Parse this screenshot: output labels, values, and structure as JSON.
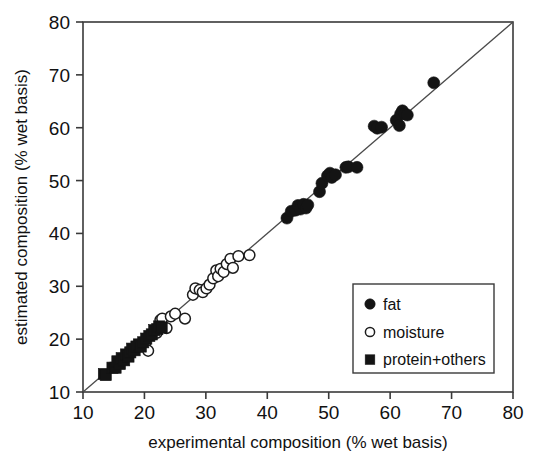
{
  "chart_data": {
    "type": "scatter",
    "title": "",
    "xlabel": "experimental composition (% wet basis)",
    "ylabel": "estimated composition (% wet basis)",
    "xlim": [
      10,
      80
    ],
    "ylim": [
      10,
      80
    ],
    "xticks": [
      10,
      20,
      30,
      40,
      50,
      60,
      70,
      80
    ],
    "yticks": [
      10,
      20,
      30,
      40,
      50,
      60,
      70,
      80
    ],
    "xtick_labels": [
      "10",
      "20",
      "30",
      "40",
      "50",
      "60",
      "70",
      "80"
    ],
    "ytick_labels": [
      "10",
      "20",
      "30",
      "40",
      "50",
      "60",
      "70",
      "80"
    ],
    "grid": false,
    "legend_position": "lower-right",
    "reference_line": {
      "name": "identity-line",
      "description": "1:1 diagonal",
      "from": [
        10,
        10
      ],
      "to": [
        80,
        80
      ]
    },
    "series": [
      {
        "name": "fat",
        "marker": "filled-circle",
        "color": "#141414",
        "points": [
          [
            43.2,
            42.9
          ],
          [
            43.9,
            44.2
          ],
          [
            44.6,
            44.4
          ],
          [
            45.0,
            45.3
          ],
          [
            45.4,
            44.6
          ],
          [
            45.9,
            45.5
          ],
          [
            46.3,
            44.8
          ],
          [
            46.6,
            45.4
          ],
          [
            48.5,
            47.9
          ],
          [
            48.9,
            49.5
          ],
          [
            49.8,
            50.9
          ],
          [
            50.2,
            51.4
          ],
          [
            50.5,
            50.6
          ],
          [
            51.1,
            51.1
          ],
          [
            52.8,
            52.5
          ],
          [
            53.2,
            52.6
          ],
          [
            54.6,
            52.5
          ],
          [
            57.4,
            60.3
          ],
          [
            57.9,
            59.9
          ],
          [
            58.6,
            60.1
          ],
          [
            61.0,
            61.4
          ],
          [
            61.5,
            60.4
          ],
          [
            61.7,
            62.6
          ],
          [
            62.0,
            63.2
          ],
          [
            62.4,
            62.6
          ],
          [
            62.8,
            62.4
          ],
          [
            67.1,
            68.5
          ]
        ]
      },
      {
        "name": "moisture",
        "marker": "open-circle",
        "color": "#ffffff",
        "points": [
          [
            20.1,
            19.2
          ],
          [
            20.6,
            17.8
          ],
          [
            22.0,
            21.2
          ],
          [
            22.6,
            23.6
          ],
          [
            22.9,
            23.9
          ],
          [
            23.6,
            22.1
          ],
          [
            24.3,
            24.3
          ],
          [
            25.0,
            24.8
          ],
          [
            26.6,
            23.9
          ],
          [
            27.9,
            28.4
          ],
          [
            28.3,
            29.6
          ],
          [
            29.0,
            29.3
          ],
          [
            29.5,
            28.9
          ],
          [
            30.1,
            29.6
          ],
          [
            30.6,
            30.3
          ],
          [
            31.2,
            31.5
          ],
          [
            31.7,
            33.0
          ],
          [
            32.0,
            31.9
          ],
          [
            32.4,
            33.3
          ],
          [
            32.9,
            32.7
          ],
          [
            33.4,
            34.2
          ],
          [
            34.0,
            35.2
          ],
          [
            34.4,
            33.5
          ],
          [
            35.3,
            35.7
          ],
          [
            37.1,
            35.9
          ]
        ]
      },
      {
        "name": "protein+others",
        "marker": "filled-square",
        "color": "#141414",
        "points": [
          [
            13.4,
            13.4
          ],
          [
            13.7,
            13.2
          ],
          [
            14.8,
            14.6
          ],
          [
            15.3,
            14.6
          ],
          [
            15.6,
            15.8
          ],
          [
            16.0,
            15.3
          ],
          [
            16.3,
            16.4
          ],
          [
            16.7,
            16.0
          ],
          [
            17.0,
            17.1
          ],
          [
            17.4,
            16.7
          ],
          [
            17.7,
            17.5
          ],
          [
            18.0,
            18.2
          ],
          [
            18.4,
            17.9
          ],
          [
            18.7,
            18.6
          ],
          [
            19.1,
            19.0
          ],
          [
            19.4,
            18.6
          ],
          [
            19.8,
            19.4
          ],
          [
            20.3,
            20.1
          ],
          [
            20.8,
            20.6
          ],
          [
            21.2,
            20.9
          ],
          [
            21.6,
            21.7
          ],
          [
            22.1,
            21.9
          ],
          [
            22.4,
            22.4
          ],
          [
            22.8,
            22.2
          ]
        ]
      }
    ]
  },
  "legend": {
    "items": [
      {
        "label": "fat",
        "marker": "filled-circle"
      },
      {
        "label": "moisture",
        "marker": "open-circle"
      },
      {
        "label": "protein+others",
        "marker": "filled-square"
      }
    ]
  },
  "axes": {
    "x_title": "experimental composition (% wet basis)",
    "y_title": "estimated composition (% wet basis)"
  }
}
